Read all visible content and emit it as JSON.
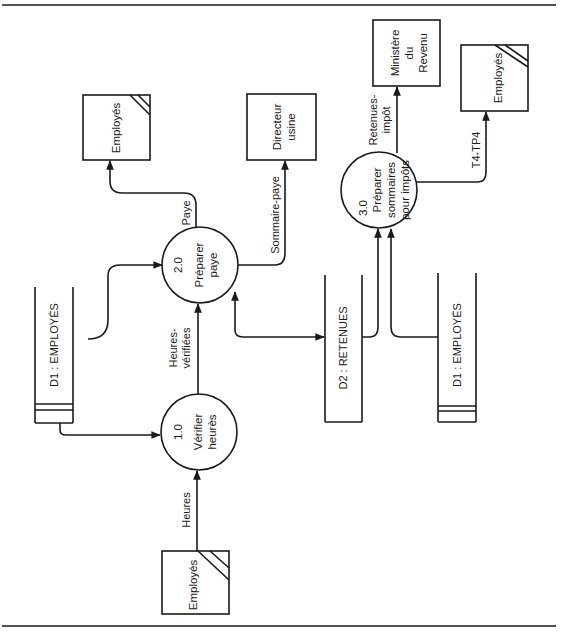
{
  "diagram": {
    "type": "data-flow-diagram",
    "orientation": "rotated -90deg",
    "colors": {
      "ink": "#1a1a1a",
      "background": "#ffffff"
    },
    "entities": [
      {
        "id": "emp_top",
        "label": "Employés",
        "duplicate_marker": true
      },
      {
        "id": "directeur",
        "line1": "Directeur",
        "line2": "usine"
      },
      {
        "id": "ministere",
        "line1": "Ministère",
        "line2": "du",
        "line3": "Revenu"
      },
      {
        "id": "emp_right",
        "label": "Employés",
        "duplicate_marker": true
      },
      {
        "id": "emp_bottom",
        "label": "Employés",
        "duplicate_marker": true
      }
    ],
    "processes": [
      {
        "id": "p1",
        "number": "1.0",
        "line1": "Vérifier",
        "line2": "heurès"
      },
      {
        "id": "p2",
        "number": "2.0",
        "line1": "Préparer",
        "line2": "paye"
      },
      {
        "id": "p3",
        "number": "3.0",
        "line1": "Préparer",
        "line2": "sommaires",
        "line3": "pour impôts"
      }
    ],
    "stores": [
      {
        "id": "d1_left",
        "label": "D1 :  EMPLOYÉS"
      },
      {
        "id": "d2",
        "label": "D2 :  RETENUES"
      },
      {
        "id": "d1_right",
        "label": "D1 :  EMPLOYÉS"
      }
    ],
    "flows": [
      {
        "from": "emp_bottom",
        "to": "p1",
        "label": "Heures"
      },
      {
        "from": "d1_left",
        "to": "p1",
        "label": ""
      },
      {
        "from": "p1",
        "to": "p2",
        "line1": "Heures-",
        "line2": "vérifiées"
      },
      {
        "from": "d1_left",
        "to": "p2",
        "label": ""
      },
      {
        "from": "p2",
        "to": "emp_top",
        "label": "Paye"
      },
      {
        "from": "p2",
        "to": "directeur",
        "label": "Sommaire-paye"
      },
      {
        "from": "p2",
        "to": "d2",
        "label": "",
        "bidirectional": true
      },
      {
        "from": "d2",
        "to": "p3",
        "label": ""
      },
      {
        "from": "d1_right",
        "to": "p3",
        "label": ""
      },
      {
        "from": "p3",
        "to": "ministere",
        "line1": "Retenues-",
        "line2": "impôt"
      },
      {
        "from": "p3",
        "to": "emp_right",
        "label": "T4-TP4"
      }
    ]
  }
}
